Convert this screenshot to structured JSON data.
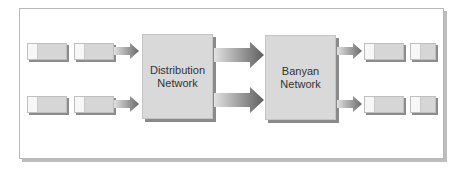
{
  "diagram": {
    "nodes": [
      {
        "id": "distribution",
        "label_line1": "Distribution",
        "label_line2": "Network"
      },
      {
        "id": "banyan",
        "label_line1": "Banyan",
        "label_line2": "Network"
      }
    ],
    "inputs": {
      "rows": 2,
      "cells_per_row": 2
    },
    "outputs": {
      "rows": 2,
      "cells_per_row": 2
    },
    "edges": [
      {
        "from": "input-queue-1",
        "to": "distribution"
      },
      {
        "from": "input-queue-2",
        "to": "distribution"
      },
      {
        "from": "distribution",
        "to": "banyan",
        "count": 2
      },
      {
        "from": "banyan",
        "to": "output-queue-1"
      },
      {
        "from": "banyan",
        "to": "output-queue-2"
      }
    ],
    "colors": {
      "box_fill": "#d9d9d9",
      "shadow": "#8a8a8a",
      "frame_border": "#b8b8b8"
    }
  }
}
